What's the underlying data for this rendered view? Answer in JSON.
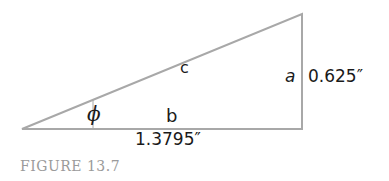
{
  "diagram": {
    "type": "right-triangle",
    "labels": {
      "hypotenuse": "c",
      "opposite": "a",
      "adjacent": "b",
      "angle": "ϕ",
      "opposite_value": "0.625″",
      "adjacent_value": "1.3795″"
    },
    "colors": {
      "line": "#a8a8a8",
      "text": "#1a1a1a",
      "caption": "#9a9a9a"
    }
  },
  "caption": "FIGURE 13.7"
}
